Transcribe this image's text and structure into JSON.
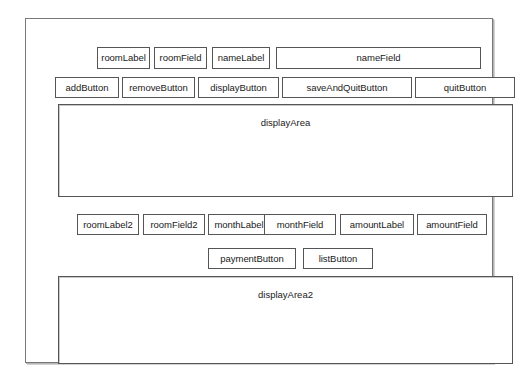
{
  "window": {
    "name": "application-window",
    "background_color": "#ffffff",
    "border_color": "#787878"
  },
  "rows": {
    "entry_row": {
      "name": "room-name-entry-row",
      "widgets": [
        {
          "id": "roomLabel",
          "label": "roomLabel",
          "kind": "label"
        },
        {
          "id": "roomField",
          "label": "roomField",
          "kind": "field"
        },
        {
          "id": "nameLabel",
          "label": "nameLabel",
          "kind": "label"
        },
        {
          "id": "nameField",
          "label": "nameField",
          "kind": "field"
        }
      ]
    },
    "button_row": {
      "name": "main-action-button-row",
      "widgets": [
        {
          "id": "addButton",
          "label": "addButton",
          "kind": "button"
        },
        {
          "id": "removeButton",
          "label": "removeButton",
          "kind": "button"
        },
        {
          "id": "displayButton",
          "label": "displayButton",
          "kind": "button"
        },
        {
          "id": "saveAndQuitButton",
          "label": "saveAndQuitButton",
          "kind": "button"
        },
        {
          "id": "quitButton",
          "label": "quitButton",
          "kind": "button"
        }
      ]
    },
    "payment_row": {
      "name": "payment-entry-row",
      "widgets": [
        {
          "id": "roomLabel2",
          "label": "roomLabel2",
          "kind": "label"
        },
        {
          "id": "roomField2",
          "label": "roomField2",
          "kind": "field"
        },
        {
          "id": "monthLabel",
          "label": "monthLabel",
          "kind": "label"
        },
        {
          "id": "monthField",
          "label": "monthField",
          "kind": "field"
        },
        {
          "id": "amountLabel",
          "label": "amountLabel",
          "kind": "label"
        },
        {
          "id": "amountField",
          "label": "amountField",
          "kind": "field"
        }
      ]
    },
    "payment_button_row": {
      "name": "payment-action-button-row",
      "widgets": [
        {
          "id": "paymentButton",
          "label": "paymentButton",
          "kind": "button"
        },
        {
          "id": "listButton",
          "label": "listButton",
          "kind": "button"
        }
      ]
    }
  },
  "display_areas": [
    {
      "id": "displayArea",
      "label": "displayArea",
      "content": ""
    },
    {
      "id": "displayArea2",
      "label": "displayArea2",
      "content": ""
    }
  ]
}
